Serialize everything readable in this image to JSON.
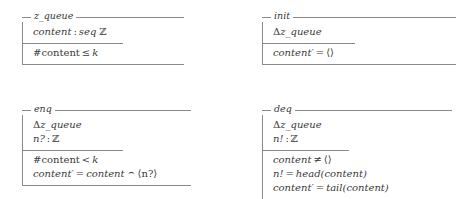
{
  "document": {
    "notation": "Z",
    "background_color": "#ffffff",
    "rule_color": "#8a8a8a",
    "text_color": "#3a3a3a"
  },
  "schemas": [
    {
      "id": "z-queue",
      "name": "z_queue",
      "declarations": [
        {
          "lhs": "content",
          "colon": ":",
          "type_prefix": "seq",
          "type": "ℤ"
        }
      ],
      "predicates": [
        {
          "lhs": "#content",
          "op": "≤",
          "rhs": "k"
        }
      ]
    },
    {
      "id": "init",
      "name": "init",
      "declarations": [
        {
          "delta": "Δ",
          "lhs": "z_queue"
        }
      ],
      "predicates": [
        {
          "lhs": "content′",
          "op": "=",
          "rhs": "⟨⟩"
        }
      ]
    },
    {
      "id": "enq",
      "name": "enq",
      "declarations": [
        {
          "delta": "Δ",
          "lhs": "z_queue"
        },
        {
          "lhs": "n?",
          "colon": ":",
          "type": "ℤ"
        }
      ],
      "predicates": [
        {
          "lhs": "#content",
          "op": "<",
          "rhs": "k"
        },
        {
          "lhs": "content′",
          "op": "=",
          "rhs_a": "content",
          "cat": "⌢",
          "rhs_b": "⟨n?⟩"
        }
      ]
    },
    {
      "id": "deq",
      "name": "deq",
      "declarations": [
        {
          "delta": "Δ",
          "lhs": "z_queue"
        },
        {
          "lhs": "n!",
          "colon": ":",
          "type": "ℤ"
        }
      ],
      "predicates": [
        {
          "lhs": "content",
          "op": "≠",
          "rhs": "⟨⟩"
        },
        {
          "lhs": "n!",
          "op": "=",
          "rhs": "head(content)"
        },
        {
          "lhs": "content′",
          "op": "=",
          "rhs": "tail(content)"
        }
      ]
    }
  ]
}
